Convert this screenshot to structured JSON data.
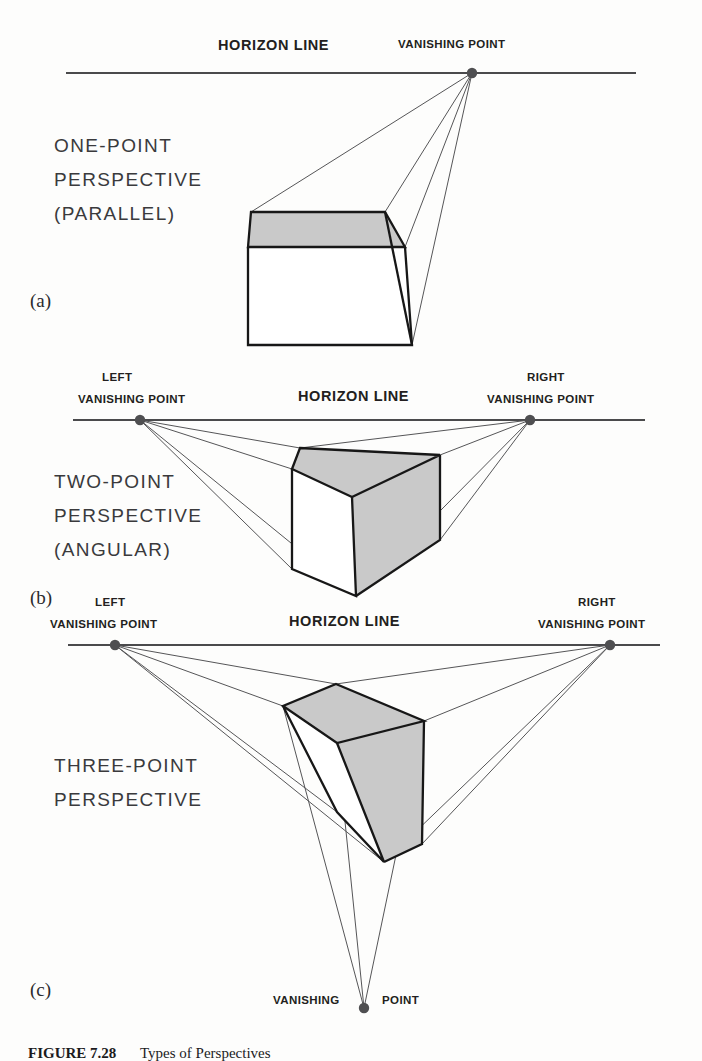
{
  "figure": {
    "number": "FIGURE 7.28",
    "title": "Types of Perspectives"
  },
  "colors": {
    "ink": "#231f20",
    "line": "#4a4a4c",
    "ray": "#555557",
    "shade": "#c9c9c9",
    "vanishing_point": "#4f4f51"
  },
  "panels": [
    {
      "letter": "(a)",
      "title_lines": [
        "ONE-POINT",
        "PERSPECTIVE",
        "(PARALLEL)"
      ],
      "horizon_label": "HORIZON LINE",
      "vanishing_points": [
        {
          "label_lines": [
            "VANISHING POINT"
          ],
          "position": "center-right"
        }
      ]
    },
    {
      "letter": "(b)",
      "title_lines": [
        "TWO-POINT",
        "PERSPECTIVE",
        "(ANGULAR)"
      ],
      "horizon_label": "HORIZON LINE",
      "vanishing_points": [
        {
          "label_lines": [
            "LEFT",
            "VANISHING POINT"
          ],
          "position": "left"
        },
        {
          "label_lines": [
            "RIGHT",
            "VANISHING POINT"
          ],
          "position": "right"
        }
      ]
    },
    {
      "letter": "(c)",
      "title_lines": [
        "THREE-POINT",
        "PERSPECTIVE"
      ],
      "horizon_label": "HORIZON LINE",
      "vanishing_points": [
        {
          "label_lines": [
            "LEFT",
            "VANISHING POINT"
          ],
          "position": "left"
        },
        {
          "label_lines": [
            "RIGHT",
            "VANISHING POINT"
          ],
          "position": "right"
        },
        {
          "label_lines": [
            "VANISHING",
            "POINT"
          ],
          "position": "bottom"
        }
      ]
    }
  ],
  "labels": {
    "horizon_line": "HORIZON LINE",
    "vanishing_point": "VANISHING POINT",
    "left": "LEFT",
    "right": "RIGHT",
    "vanishing": "VANISHING",
    "point": "POINT"
  }
}
